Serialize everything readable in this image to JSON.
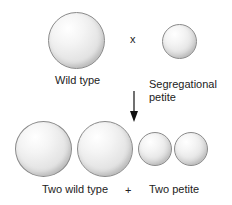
{
  "diagram": {
    "top_row": {
      "wild_type_label": "Wild type",
      "cross_symbol": "x",
      "petite_label_line1": "Segregational",
      "petite_label_line2": "petite"
    },
    "bottom_row": {
      "wild_type_label": "Two wild type",
      "plus_symbol": "+",
      "petite_label": "Two petite"
    },
    "colors": {
      "cell_outline": "#8a8a8a",
      "cell_fill": "#e6e6e6",
      "text": "#222222",
      "arrow": "#111111"
    }
  }
}
